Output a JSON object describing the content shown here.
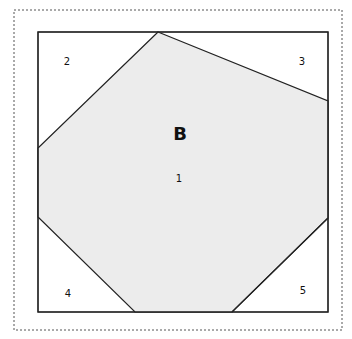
{
  "diagram": {
    "title_letter": "B",
    "regions": [
      {
        "id": "1",
        "label": "1",
        "fill": "#ececec"
      },
      {
        "id": "2",
        "label": "2",
        "fill": "#ffffff"
      },
      {
        "id": "3",
        "label": "3",
        "fill": "#ffffff"
      },
      {
        "id": "4",
        "label": "4",
        "fill": "#ffffff"
      },
      {
        "id": "5",
        "label": "5",
        "fill": "#ececec"
      }
    ],
    "colors": {
      "shaded": "#ececec",
      "line": "#222222",
      "border_dashed": "#555555"
    }
  }
}
